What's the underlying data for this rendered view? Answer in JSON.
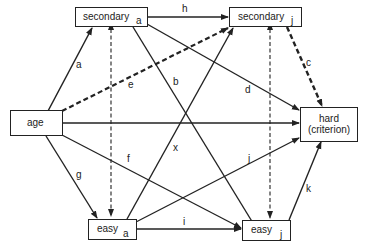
{
  "nodes": {
    "secondary_a": {
      "label": "secondary",
      "sub": "a"
    },
    "secondary_j": {
      "label": "secondary",
      "sub": "j"
    },
    "age": {
      "label": "age"
    },
    "hard": {
      "label_line1": "hard",
      "label_line2": "(criterion)"
    },
    "easy_a": {
      "label": "easy",
      "sub": "a"
    },
    "easy_j": {
      "label": "easy",
      "sub": "j"
    }
  },
  "edges": [
    {
      "id": "a",
      "from": "age",
      "to": "secondary_a",
      "style": "solid"
    },
    {
      "id": "b",
      "from": "secondary_a",
      "to": "easy_j",
      "style": "solid"
    },
    {
      "id": "c",
      "from": "secondary_j",
      "to": "hard",
      "style": "thick-dashed"
    },
    {
      "id": "d",
      "from": "secondary_a",
      "to": "hard",
      "style": "solid"
    },
    {
      "id": "e",
      "from": "age",
      "to": "secondary_j",
      "style": "thick-dashed"
    },
    {
      "id": "f",
      "from": "age",
      "to": "easy_j",
      "style": "solid"
    },
    {
      "id": "g",
      "from": "age",
      "to": "easy_a",
      "style": "solid"
    },
    {
      "id": "h",
      "from": "secondary_a",
      "to": "secondary_j",
      "style": "solid"
    },
    {
      "id": "i",
      "from": "easy_a",
      "to": "easy_j",
      "style": "solid"
    },
    {
      "id": "j",
      "from": "easy_a",
      "to": "hard",
      "style": "solid"
    },
    {
      "id": "k",
      "from": "easy_j",
      "to": "hard",
      "style": "solid"
    },
    {
      "id": "x",
      "from": "easy_a",
      "to": "secondary_j",
      "style": "solid"
    },
    {
      "id": "",
      "from": "age",
      "to": "hard",
      "style": "solid"
    },
    {
      "id": "",
      "from": "secondary_a",
      "to": "easy_a",
      "style": "dashed-bidirectional"
    },
    {
      "id": "",
      "from": "secondary_j",
      "to": "easy_j",
      "style": "dashed-bidirectional"
    }
  ],
  "edge_labels": {
    "a": "a",
    "b": "b",
    "c": "c",
    "d": "d",
    "e": "e",
    "f": "f",
    "g": "g",
    "h": "h",
    "i": "i",
    "j": "j",
    "k": "k",
    "x": "x"
  }
}
